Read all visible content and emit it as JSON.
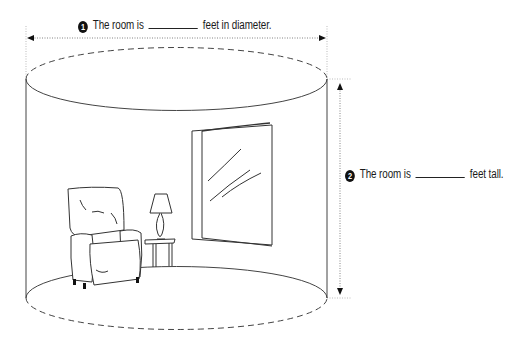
{
  "diagram": {
    "questions": [
      {
        "number": "1",
        "prefix": "The room is",
        "blank": "",
        "suffix": "feet in diameter.",
        "dimension": "diameter"
      },
      {
        "number": "2",
        "prefix": "The room is",
        "blank": "",
        "suffix": "feet tall.",
        "dimension": "height"
      }
    ],
    "shape": "cylinder",
    "contents": [
      "armchair",
      "side-table",
      "table-lamp",
      "window"
    ],
    "colors": {
      "line": "#3a3a3a",
      "guide": "#9a9a9a",
      "background": "#ffffff"
    }
  }
}
